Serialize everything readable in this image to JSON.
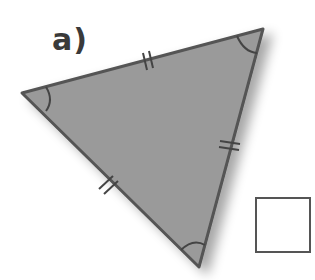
{
  "label": "a)",
  "triangle": {
    "vertices": [
      [
        22,
        93
      ],
      [
        263,
        29
      ],
      [
        199,
        267
      ]
    ],
    "fill": "#9a9a9a",
    "stroke": "#555555",
    "side_marks": "double tick marks on all three sides (equal sides)",
    "angle_marks": "single arc at each vertex (equal angles)"
  },
  "answer_box": {
    "value": ""
  }
}
